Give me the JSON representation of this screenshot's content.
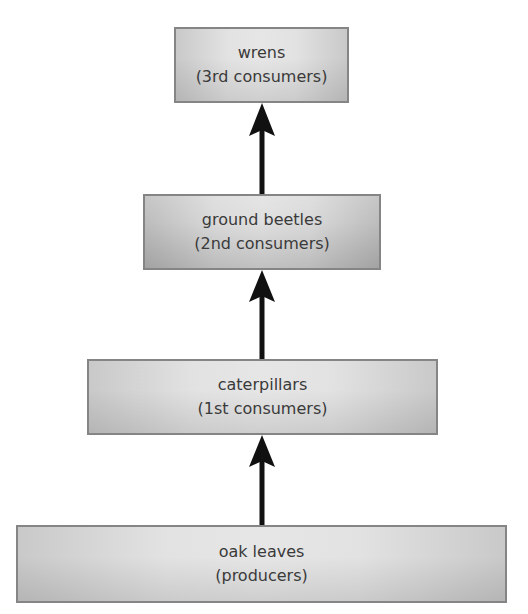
{
  "diagram": {
    "type": "food-chain",
    "direction": "bottom-to-top",
    "levels": [
      {
        "name": "wrens",
        "role": "(3rd consumers)"
      },
      {
        "name": "ground beetles",
        "role": "(2nd consumers)"
      },
      {
        "name": "caterpillars",
        "role": "(1st consumers)"
      },
      {
        "name": "oak leaves",
        "role": "(producers)"
      }
    ],
    "arrows": [
      {
        "from": "oak leaves",
        "to": "caterpillars"
      },
      {
        "from": "caterpillars",
        "to": "ground beetles"
      },
      {
        "from": "ground beetles",
        "to": "wrens"
      }
    ],
    "colors": {
      "box_border": "#858585",
      "box_fill_center": "#e4e4e4",
      "box_fill_edge": "#c6c6c6",
      "text": "#3a3a3a",
      "arrow": "#111111"
    }
  }
}
